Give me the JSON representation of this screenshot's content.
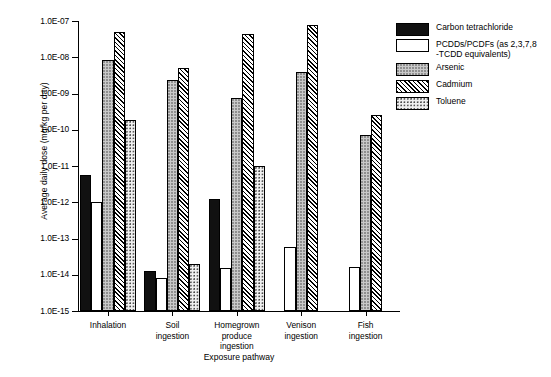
{
  "chart_data": {
    "type": "bar",
    "title": "",
    "xlabel": "Exposure pathway",
    "ylabel": "Average daily dose (mg/kg per day)",
    "scale": "log",
    "ylim": [
      1e-15,
      1e-07
    ],
    "ytick_labels": [
      "1.0E-07",
      "1.0E-08",
      "1.0E-09",
      "1.0E-10",
      "1.0E-11",
      "1.0E-12",
      "1.0E-13",
      "1.0E-14",
      "1.0E-15"
    ],
    "ytick_values": [
      1e-07,
      1e-08,
      1e-09,
      1e-10,
      1e-11,
      1e-12,
      1e-13,
      1e-14,
      1e-15
    ],
    "grid": false,
    "legend_position": "right",
    "categories": [
      "Inhalation",
      "Soil\ningestion",
      "Homegrown\nproduce\ningestion",
      "Venison\ningestion",
      "Fish\ningestion"
    ],
    "series": [
      {
        "name": "Carbon tetrachloride",
        "fill": "solid-black",
        "values": [
          5.5e-12,
          1.3e-14,
          1.2e-12,
          null,
          null
        ]
      },
      {
        "name": "PCDDs/PCDFs (as 2,3,7,8\n-TCDD equivalents)",
        "fill": "white",
        "values": [
          1e-12,
          8e-15,
          1.5e-14,
          6e-14,
          1.6e-14
        ]
      },
      {
        "name": "Arsenic",
        "fill": "light-gray-dotted",
        "values": [
          8.5e-09,
          2.3e-09,
          7.5e-10,
          4e-09,
          7e-11
        ]
      },
      {
        "name": "Cadmium",
        "fill": "diagonal-hatch",
        "values": [
          5e-08,
          5e-09,
          4.5e-08,
          8e-08,
          2.5e-10
        ]
      },
      {
        "name": "Toluene",
        "fill": "fine-dots",
        "values": [
          1.8e-10,
          2e-14,
          1e-11,
          null,
          null
        ]
      }
    ]
  },
  "legend": {
    "items": [
      {
        "label": "Carbon tetrachloride",
        "swatch": "solid-black-swatch"
      },
      {
        "label": "PCDDs/PCDFs (as 2,3,7,8\n-TCDD equivalents)",
        "swatch": "white-swatch"
      },
      {
        "label": "Arsenic",
        "swatch": "light-gray-dotted-swatch"
      },
      {
        "label": "Cadmium",
        "swatch": "diagonal-hatch-swatch"
      },
      {
        "label": "Toluene",
        "swatch": "fine-dots-swatch"
      }
    ]
  }
}
